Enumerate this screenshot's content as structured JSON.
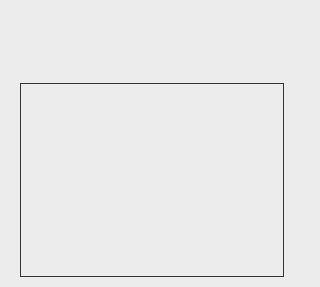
{
  "colors": {
    "light": "#c9c9c9",
    "medium": "#a2a2a2",
    "middark": "#6f6f6f",
    "dark": "#3d3d3d",
    "border": "#333333",
    "arrow": "#111111",
    "background": "#ececec"
  },
  "top_row": {
    "tiles": [
      {
        "x": 12,
        "y": 12,
        "w": 66,
        "h": 66,
        "upper": "light",
        "lower": "medium"
      },
      {
        "x": 82,
        "y": 12,
        "w": 65,
        "h": 66,
        "upper": "light",
        "lower": "dark"
      },
      {
        "x": 150,
        "y": 12,
        "w": 66,
        "h": 66,
        "upper": "light",
        "lower": "medium"
      },
      {
        "x": 227,
        "y": 12,
        "w": 66,
        "h": 66,
        "upper": "light",
        "lower": "dark"
      }
    ],
    "arrows": [
      {
        "x": 70,
        "y": 40,
        "dir": "right"
      },
      {
        "x": 140,
        "y": 40,
        "dir": "right"
      },
      {
        "x": 213,
        "y": 40,
        "dir": "right"
      }
    ]
  },
  "grid": {
    "rows": [
      [
        "middark",
        "medium",
        "medium",
        "middark"
      ],
      [
        "dark",
        "middark",
        "dark",
        "middark"
      ],
      [
        "middark",
        "medium",
        "dark",
        "middark"
      ]
    ],
    "arrows": [
      {
        "x": 71,
        "y": 110,
        "dir": "left"
      },
      {
        "x": 137,
        "y": 110,
        "dir": "left"
      },
      {
        "x": 202,
        "y": 110,
        "dir": "left"
      },
      {
        "x": 76,
        "y": 174,
        "dir": "right"
      },
      {
        "x": 142,
        "y": 174,
        "dir": "right"
      },
      {
        "x": 208,
        "y": 174,
        "dir": "right"
      },
      {
        "x": 71,
        "y": 240,
        "dir": "left"
      },
      {
        "x": 137,
        "y": 240,
        "dir": "left"
      },
      {
        "x": 202,
        "y": 240,
        "dir": "left"
      }
    ]
  },
  "side_arrows": [
    {
      "x": 303,
      "y": 68,
      "dir": "up"
    },
    {
      "x": 303,
      "y": 138,
      "dir": "up"
    },
    {
      "x": 303,
      "y": 196,
      "dir": "up"
    }
  ]
}
